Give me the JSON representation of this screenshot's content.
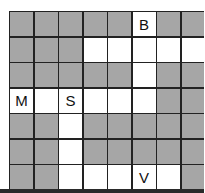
{
  "grid": {
    "rows": 7,
    "cols": 8,
    "colors": {
      "blocked": "#a6a6a6",
      "open": "#ffffff",
      "line": "#222222"
    },
    "cells": [
      [
        "G",
        "G",
        "G",
        "G",
        "G",
        "W",
        "G",
        "G"
      ],
      [
        "G",
        "G",
        "G",
        "W",
        "W",
        "W",
        "W",
        "W"
      ],
      [
        "G",
        "G",
        "G",
        "G",
        "G",
        "W",
        "G",
        "G"
      ],
      [
        "W",
        "W",
        "W",
        "W",
        "W",
        "W",
        "G",
        "G"
      ],
      [
        "G",
        "G",
        "W",
        "G",
        "G",
        "G",
        "G",
        "G"
      ],
      [
        "G",
        "G",
        "W",
        "G",
        "G",
        "G",
        "G",
        "G"
      ],
      [
        "G",
        "G",
        "W",
        "W",
        "W",
        "W",
        "W",
        "G"
      ]
    ],
    "labels": [
      {
        "row": 0,
        "col": 5,
        "text": "B"
      },
      {
        "row": 3,
        "col": 0,
        "text": "M"
      },
      {
        "row": 3,
        "col": 2,
        "text": "S"
      },
      {
        "row": 6,
        "col": 5,
        "text": "V"
      }
    ]
  }
}
